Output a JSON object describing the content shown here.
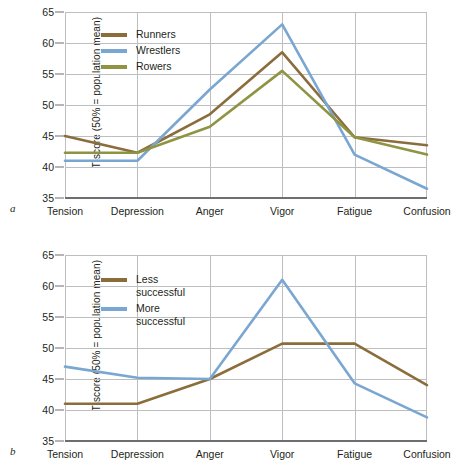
{
  "figure": {
    "background": "#ffffff",
    "axis_color": "#6d6e71",
    "grid_color": "#bcbec0",
    "text_color": "#231f20"
  },
  "panels": [
    {
      "letter": "a",
      "ylabel": "T-score (50% = population mean)",
      "legend": [
        {
          "label": "Runners",
          "color": "#8a6d3b"
        },
        {
          "label": "Wrestlers",
          "color": "#7aa6d2"
        },
        {
          "label": "Rowers",
          "color": "#8e9442"
        }
      ]
    },
    {
      "letter": "b",
      "ylabel": "T-score (50% = population mean)",
      "legend": [
        {
          "label": "Less\nsuccessful",
          "color": "#8a6d3b"
        },
        {
          "label": "More\nsuccessful",
          "color": "#7aa6d2"
        }
      ]
    }
  ],
  "chart_data": [
    {
      "type": "line",
      "panel": "a",
      "title": "",
      "xlabel": "",
      "ylabel": "T-score (50% = population mean)",
      "categories": [
        "Tension",
        "Depression",
        "Anger",
        "Vigor",
        "Fatigue",
        "Confusion"
      ],
      "yticks": [
        35,
        40,
        45,
        50,
        55,
        60,
        65
      ],
      "ylim": [
        35,
        65
      ],
      "grid": true,
      "legend_position": "upper-left",
      "series": [
        {
          "name": "Runners",
          "color": "#8a6d3b",
          "values": [
            45.0,
            42.3,
            48.5,
            58.5,
            44.8,
            43.5
          ]
        },
        {
          "name": "Wrestlers",
          "color": "#7aa6d2",
          "values": [
            41.0,
            41.0,
            52.5,
            63.0,
            42.0,
            36.5
          ]
        },
        {
          "name": "Rowers",
          "color": "#8e9442",
          "values": [
            42.3,
            42.3,
            46.5,
            55.5,
            44.8,
            42.0
          ]
        }
      ]
    },
    {
      "type": "line",
      "panel": "b",
      "title": "",
      "xlabel": "",
      "ylabel": "T-score (50% = population mean)",
      "categories": [
        "Tension",
        "Depression",
        "Anger",
        "Vigor",
        "Fatigue",
        "Confusion"
      ],
      "yticks": [
        35,
        40,
        45,
        50,
        55,
        60,
        65
      ],
      "ylim": [
        35,
        65
      ],
      "grid": true,
      "legend_position": "upper-left",
      "series": [
        {
          "name": "Less successful",
          "color": "#8a6d3b",
          "values": [
            41.0,
            41.0,
            45.0,
            50.7,
            50.7,
            44.0
          ]
        },
        {
          "name": "More successful",
          "color": "#7aa6d2",
          "values": [
            47.0,
            45.2,
            45.0,
            61.0,
            44.3,
            38.8
          ]
        }
      ]
    }
  ]
}
